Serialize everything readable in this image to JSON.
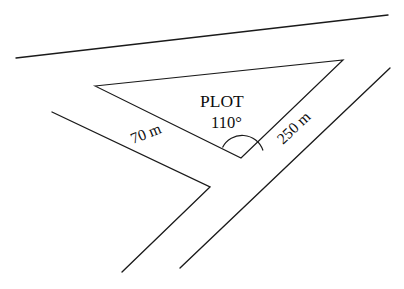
{
  "diagram": {
    "type": "surveying-plot-geometry",
    "background_color": "#ffffff",
    "line_color": "#1a1a1a",
    "labels": {
      "plot_name": "PLOT",
      "angle": "110°",
      "side_left": "70 m",
      "side_right": "250 m"
    },
    "measurements": {
      "included_angle_degrees": 110,
      "side_left_length": "70 m",
      "side_right_length": "250 m"
    },
    "plot_shape": {
      "name": "triangular-plot",
      "vertices": [
        {
          "name": "west-corner",
          "x": 95,
          "y": 86
        },
        {
          "name": "north-east-apex",
          "x": 343,
          "y": 60
        },
        {
          "name": "south-angle-vertex",
          "x": 241,
          "y": 158
        }
      ]
    },
    "roads": [
      {
        "name": "top-road",
        "x1": 16,
        "y1": 58,
        "x2": 388,
        "y2": 15
      },
      {
        "name": "west-branch-road-upper",
        "x1": 52,
        "y1": 112,
        "x2": 210,
        "y2": 187
      },
      {
        "name": "west-branch-road-lower",
        "x1": 210,
        "y1": 187,
        "x2": 122,
        "y2": 272
      },
      {
        "name": "east-diagonal-road",
        "x1": 390,
        "y1": 68,
        "x2": 180,
        "y2": 268
      }
    ],
    "angle_arc": {
      "name": "angle-arc-110",
      "center_x": 241,
      "center_y": 158,
      "radius": 22
    }
  }
}
